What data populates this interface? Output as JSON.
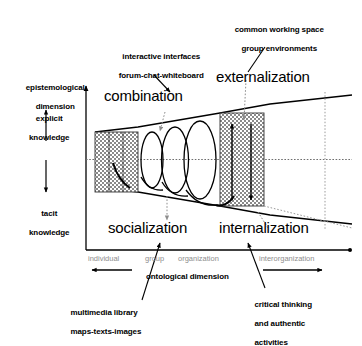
{
  "figure": {
    "type": "diagram",
    "background": "#ffffff",
    "ink": "#000000",
    "tick_color": "#8d8d8d",
    "hatch_color": "#8a8a8a"
  },
  "axes": {
    "y_axis": {
      "title_line1": "epistemological",
      "title_line2": "dimension",
      "top_label_line1": "explicit",
      "top_label_line2": "knowledge",
      "bottom_label_line1": "tacit",
      "bottom_label_line2": "knowledge"
    },
    "x_axis": {
      "title": "ontological dimension",
      "ticks": [
        "individual",
        "group",
        "organization",
        "interorganization"
      ]
    }
  },
  "modes": {
    "combination": "combination",
    "externalization": "externalization",
    "socialization": "socialization",
    "internalization": "internalization"
  },
  "annotations": {
    "interactive_interfaces": {
      "line1": "interactive interfaces",
      "line2": "forum-chat-whiteboard"
    },
    "common_working_space": {
      "line1": "common working space",
      "line2": "group environments"
    },
    "multimedia_library": {
      "line1": "multimedia library",
      "line2": "maps-texts-images"
    },
    "critical_thinking": {
      "line1": "critical thinking",
      "line2": "and authentic",
      "line3": "activities"
    }
  }
}
